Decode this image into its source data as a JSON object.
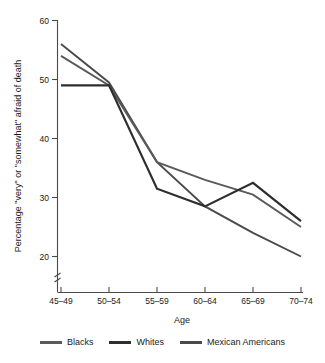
{
  "chart_data": {
    "type": "line",
    "title": "",
    "xlabel": "Age",
    "ylabel": "Percentage \"very\" or \"somewhat\" afraid of death",
    "categories": [
      "45–49",
      "50–54",
      "55–59",
      "60–64",
      "65–69",
      "70–74"
    ],
    "ylim": [
      15,
      60
    ],
    "yticks": [
      20,
      30,
      40,
      50,
      60
    ],
    "ytick_labels": [
      "20",
      "30",
      "40",
      "50",
      "60"
    ],
    "grid": false,
    "axis_break": true,
    "legend_position": "bottom",
    "series": [
      {
        "name": "Blacks",
        "color": "#5a5a5a",
        "values": [
          54.0,
          49.0,
          36.0,
          33.0,
          30.5,
          25.0
        ]
      },
      {
        "name": "Whites",
        "color": "#2e2e2e",
        "values": [
          49.0,
          49.0,
          31.5,
          28.5,
          32.5,
          26.0
        ]
      },
      {
        "name": "Mexican Americans",
        "color": "#4a4a4a",
        "values": [
          56.0,
          49.5,
          36.0,
          28.5,
          24.0,
          20.0
        ]
      }
    ]
  },
  "axes": {
    "x_axis_title": "Age",
    "y_axis_title": "Percentage \"very\" or \"somewhat\" afraid of death"
  },
  "legend": {
    "items": [
      {
        "label": "Blacks",
        "color": "#5a5a5a"
      },
      {
        "label": "Whites",
        "color": "#2e2e2e"
      },
      {
        "label": "Mexican Americans",
        "color": "#4a4a4a"
      }
    ]
  }
}
